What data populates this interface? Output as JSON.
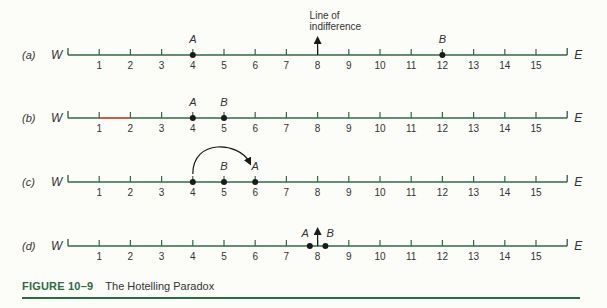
{
  "figure": {
    "number": "FIGURE 10–9",
    "title": "The Hotelling Paradox"
  },
  "colors": {
    "axis": "#2f6b45",
    "text": "#333333",
    "point": "#1a1a1a",
    "highlight": "#e0533a"
  },
  "axis": {
    "left_label": "W",
    "right_label": "E",
    "ticks": [
      1,
      2,
      3,
      4,
      5,
      6,
      7,
      8,
      9,
      10,
      11,
      12,
      13,
      14,
      15
    ],
    "x_origin_px": 68,
    "unit_px": 31.2
  },
  "panels": [
    {
      "label": "(a)",
      "letter": "a",
      "y": 55,
      "points": [
        {
          "name": "A",
          "pos": 4
        },
        {
          "name": "B",
          "pos": 12
        }
      ],
      "annotation": {
        "type": "up-arrow",
        "pos": 8,
        "text_line1": "Line of",
        "text_line2": "indifference"
      }
    },
    {
      "label": "(b)",
      "letter": "b",
      "y": 118,
      "points": [
        {
          "name": "A",
          "pos": 4
        },
        {
          "name": "B",
          "pos": 5
        }
      ],
      "highlight_segment": [
        1,
        2
      ]
    },
    {
      "label": "(c)",
      "letter": "c",
      "y": 182,
      "points": [
        {
          "name": "",
          "pos": 4
        },
        {
          "name": "B",
          "pos": 5
        },
        {
          "name": "A",
          "pos": 6
        }
      ],
      "annotation": {
        "type": "curved-arrow",
        "from": 4,
        "to": 6
      }
    },
    {
      "label": "(d)",
      "letter": "d",
      "y": 246,
      "points": [
        {
          "name": "A",
          "pos": 7.75,
          "label_side": "left"
        },
        {
          "name": "B",
          "pos": 8.25,
          "label_side": "right"
        }
      ],
      "annotation": {
        "type": "up-arrow-short",
        "pos": 8
      }
    }
  ]
}
